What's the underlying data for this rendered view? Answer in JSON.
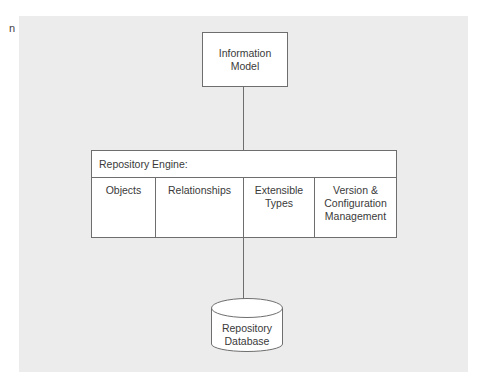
{
  "edge_fragment": "n",
  "diagram": {
    "information_model": {
      "lines": [
        "Information",
        "Model"
      ]
    },
    "repository_engine": {
      "header": "Repository Engine:",
      "columns": [
        {
          "lines": [
            "Objects"
          ]
        },
        {
          "lines": [
            "Relationships"
          ]
        },
        {
          "lines": [
            "Extensible",
            "Types"
          ]
        },
        {
          "lines": [
            "Version &",
            "Configuration",
            "Management"
          ]
        }
      ]
    },
    "repository_database": {
      "lines": [
        "Repository",
        "Database"
      ]
    },
    "colors": {
      "panel_background": "#ececec",
      "box_fill": "#ffffff",
      "stroke": "#6e6e6e",
      "text": "#3a3a3a"
    }
  }
}
